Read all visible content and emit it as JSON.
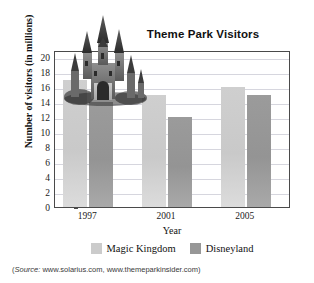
{
  "chart_data": {
    "type": "bar",
    "title": "Theme Park Visitors",
    "xlabel": "Year",
    "ylabel": "Number of visitors (in millions)",
    "categories": [
      "1997",
      "2001",
      "2005"
    ],
    "series": [
      {
        "name": "Magic Kingdom",
        "color": "#cbcbcb",
        "values": [
          17,
          15,
          16
        ]
      },
      {
        "name": "Disneyland",
        "color": "#979797",
        "values": [
          14,
          12,
          15
        ]
      }
    ],
    "ylim": [
      0,
      21
    ],
    "yticks": [
      0,
      2,
      4,
      6,
      8,
      10,
      12,
      14,
      16,
      18,
      20
    ],
    "ytick_labels": [
      "0",
      "2",
      "4",
      "6",
      "8",
      "10",
      "12",
      "14",
      "16",
      "18",
      "20"
    ],
    "grid": "horizontal",
    "legend_position": "bottom-center"
  },
  "decoration": {
    "castle_icon": "castle-illustration"
  },
  "source": {
    "label": "Source:",
    "text": " www.solarius.com, www.themeparkinsider.com",
    "open_paren": "(",
    "close_paren": ")"
  }
}
